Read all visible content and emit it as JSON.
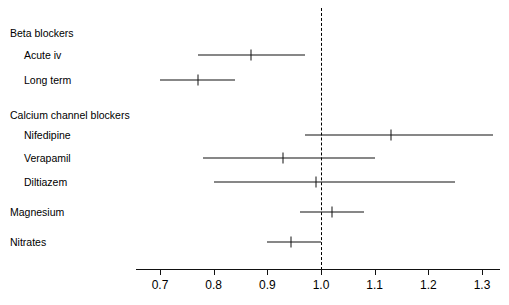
{
  "chart_data": {
    "type": "scatter",
    "plot_kind": "forest-plot",
    "title": "",
    "xlabel": "",
    "ylabel": "",
    "xlim": [
      0.66,
      1.34
    ],
    "axis_range_ticks": [
      0.7,
      1.3
    ],
    "xticks": [
      0.7,
      0.8,
      0.9,
      1.0,
      1.1,
      1.2,
      1.3
    ],
    "xtick_labels": [
      "0.7",
      "0.8",
      "0.9",
      "1.0",
      "1.1",
      "1.2",
      "1.3"
    ],
    "grid": false,
    "legend": false,
    "reference_line": {
      "value": 1.0,
      "style": "dashed",
      "color": "#000000"
    },
    "rows": [
      {
        "label": "Beta blockers",
        "type": "group-header",
        "indent": 0,
        "y": 33,
        "estimate": null,
        "ci_low": null,
        "ci_high": null
      },
      {
        "label": "Acute iv",
        "type": "data",
        "indent": 1,
        "y": 55,
        "estimate": 0.87,
        "ci_low": 0.77,
        "ci_high": 0.97
      },
      {
        "label": "Long term",
        "type": "data",
        "indent": 1,
        "y": 80,
        "estimate": 0.77,
        "ci_low": 0.7,
        "ci_high": 0.84
      },
      {
        "label": "Calcium channel blockers",
        "type": "group-header",
        "indent": 0,
        "y": 115,
        "estimate": null,
        "ci_low": null,
        "ci_high": null
      },
      {
        "label": "Nifedipine",
        "type": "data",
        "indent": 1,
        "y": 135,
        "estimate": 1.13,
        "ci_low": 0.97,
        "ci_high": 1.32
      },
      {
        "label": "Verapamil",
        "type": "data",
        "indent": 1,
        "y": 158,
        "estimate": 0.93,
        "ci_low": 0.78,
        "ci_high": 1.1
      },
      {
        "label": "Diltiazem",
        "type": "data",
        "indent": 1,
        "y": 182,
        "estimate": 0.99,
        "ci_low": 0.8,
        "ci_high": 1.25
      },
      {
        "label": "Magnesium",
        "type": "data",
        "indent": 0,
        "y": 212,
        "estimate": 1.02,
        "ci_low": 0.96,
        "ci_high": 1.08
      },
      {
        "label": "Nitrates",
        "type": "data",
        "indent": 0,
        "y": 242,
        "estimate": 0.945,
        "ci_low": 0.9,
        "ci_high": 1.0
      }
    ]
  },
  "colors": {
    "line": "#111111",
    "text": "#000000",
    "background": "#ffffff"
  },
  "geometry": {
    "axis_y": 269,
    "axis_x_start": 136,
    "axis_x_end": 500,
    "tick_label_y": 278,
    "ref_line_top": 8,
    "ref_line_bottom": 270,
    "px_at_0_7": 160,
    "px_at_1_3": 482,
    "label_x_indent0": 10,
    "label_x_indent1": 24
  }
}
